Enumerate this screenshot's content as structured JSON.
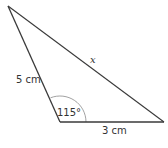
{
  "diagram": {
    "type": "triangle",
    "vertices": {
      "top": [
        8,
        6
      ],
      "bottom_left": [
        60,
        122
      ],
      "bottom_right": [
        164,
        122
      ]
    },
    "sides": {
      "left": {
        "label": "5 cm"
      },
      "bottom": {
        "label": "3 cm"
      },
      "hypotenuse": {
        "label": "x"
      }
    },
    "angle": {
      "label": "115°",
      "at": "bottom_left"
    },
    "colors": {
      "stroke": "#3a3a3a",
      "arc": "#888888",
      "text": "#333333"
    }
  }
}
